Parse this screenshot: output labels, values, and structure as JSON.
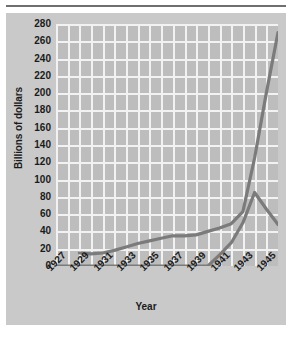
{
  "figure": {
    "ylabel": "Billions of dollars",
    "xlabel": "Year",
    "caption": ""
  },
  "colors": {
    "plot_background": "#bdbdbd",
    "card_background": "#c9c9c9",
    "gridline": "#f2f2f2",
    "series_line": "#7b7b7b",
    "text": "#1b1b1b",
    "rule": "#6f6f6f"
  },
  "chart_data": {
    "type": "line",
    "title": "",
    "xlabel": "Year",
    "ylabel": "Billions of dollars",
    "xlim": [
      1927,
      1946
    ],
    "ylim": [
      0,
      280
    ],
    "ytick_step": 20,
    "grid": true,
    "legend": "none",
    "ytick_labels": [
      "0",
      "20",
      "40",
      "60",
      "80",
      "100",
      "120",
      "140",
      "160",
      "180",
      "200",
      "220",
      "240",
      "260",
      "280"
    ],
    "xtick_labels": [
      "1927",
      "1929",
      "1931",
      "1933",
      "1935",
      "1937",
      "1939",
      "1941",
      "1943",
      "1945"
    ],
    "xtick_values": [
      1927,
      1929,
      1931,
      1933,
      1935,
      1937,
      1939,
      1941,
      1943,
      1945
    ],
    "xgrid_values": [
      1927,
      1928,
      1929,
      1930,
      1931,
      1932,
      1933,
      1934,
      1935,
      1936,
      1937,
      1938,
      1939,
      1940,
      1941,
      1942,
      1943,
      1944,
      1945,
      1946
    ],
    "series": [
      {
        "name": "Gross federal debt",
        "x": [
          1929,
          1930,
          1931,
          1932,
          1933,
          1934,
          1935,
          1936,
          1937,
          1938,
          1939,
          1940,
          1941,
          1942,
          1943,
          1944,
          1945,
          1946
        ],
        "values": [
          15,
          14,
          15,
          18,
          22,
          26,
          29,
          32,
          35,
          35,
          36,
          40,
          44,
          49,
          63,
          125,
          200,
          258
        ]
      },
      {
        "name": "Federal expenditures",
        "x": [
          1927,
          1928,
          1929,
          1930,
          1931,
          1932,
          1933,
          1934,
          1935,
          1936,
          1937,
          1938,
          1939,
          1940,
          1941,
          1942,
          1943,
          1944,
          1945,
          1946
        ],
        "values": [
          0,
          0,
          0,
          0,
          0,
          0,
          0,
          0,
          0,
          0,
          0,
          0,
          0,
          0,
          13,
          27,
          50,
          85,
          66,
          48
        ]
      }
    ],
    "series_extra_points": {
      "Gross federal debt_end": 270
    }
  }
}
